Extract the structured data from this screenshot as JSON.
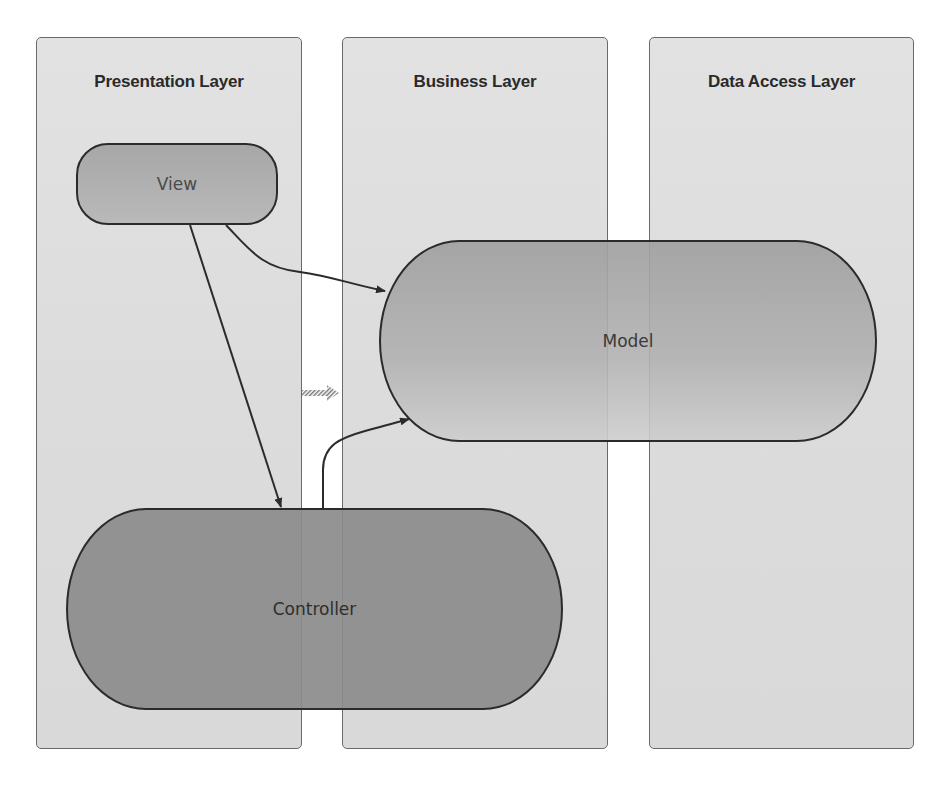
{
  "diagram": {
    "layers": [
      {
        "id": "presentation",
        "title": "Presentation Layer"
      },
      {
        "id": "business",
        "title": "Business Layer"
      },
      {
        "id": "data_access",
        "title": "Data Access Layer"
      }
    ],
    "nodes": {
      "view": {
        "label": "View",
        "layer": "Presentation Layer"
      },
      "model": {
        "label": "Model",
        "layer": "Business Layer / Data Access Layer"
      },
      "controller": {
        "label": "Controller",
        "layer": "Presentation Layer / Business Layer"
      }
    },
    "edges": [
      {
        "from": "View",
        "to": "Controller",
        "style": "solid-arrow"
      },
      {
        "from": "View",
        "to": "Model",
        "style": "solid-arrow"
      },
      {
        "from": "Controller",
        "to": "Model",
        "style": "solid-arrow"
      },
      {
        "from": "Presentation Layer",
        "to": "Business Layer",
        "style": "hatched-arrow"
      }
    ],
    "colors": {
      "layer_fill": "#dedede",
      "layer_border": "#6a6a6a",
      "view_fill": "#b0b0b0",
      "model_fill": "#acacac",
      "controller_fill": "#8c8c8c",
      "stroke": "#2b2b2b"
    }
  }
}
